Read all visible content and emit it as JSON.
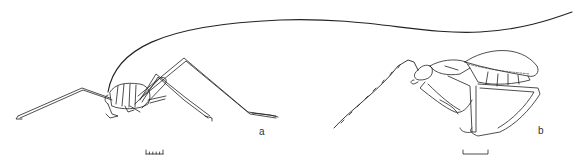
{
  "figure": {
    "panels": [
      {
        "id": "a",
        "label": "a",
        "subject": "cricket-like insect, lateral view, long antenna arching over body"
      },
      {
        "id": "b",
        "label": "b",
        "subject": "beetle-like insect, lateral view, long segmented antenna curving down"
      }
    ],
    "scale_bars": [
      {
        "panel": "a",
        "style": "ticked"
      },
      {
        "panel": "b",
        "style": "plain"
      }
    ],
    "colors": {
      "line": "#222222",
      "background": "#ffffff"
    }
  }
}
